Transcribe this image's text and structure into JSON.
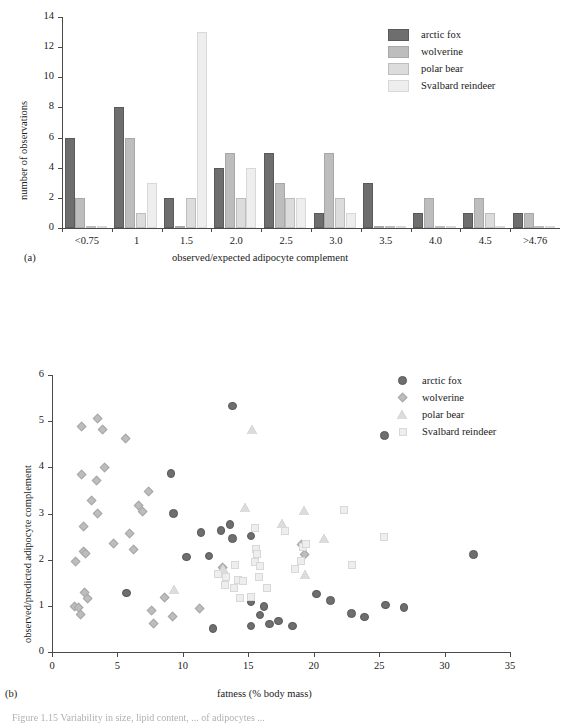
{
  "figure": {
    "caption_fragment": "Figure 1.15   Variability in size, lipid content, ... of adipocytes ..."
  },
  "colors": {
    "arctic_fox": "#6e6e6e",
    "wolverine": "#bdbdbd",
    "polar_bear": "#dcdcdc",
    "svalbard_reindeer": "#eeeeee",
    "axis": "#4a4a4a",
    "text": "#1a1a1a",
    "marker_edge": "#9a9a9a"
  },
  "panel_a": {
    "letter": "(a)",
    "chart_data": {
      "type": "bar",
      "title": "",
      "xlabel": "observed/expected adipocyte complement",
      "ylabel": "number of observations",
      "ylim": [
        0,
        14
      ],
      "ytickvals": [
        0,
        2,
        4,
        6,
        8,
        10,
        12,
        14
      ],
      "yticklabels": [
        "0",
        "2",
        "4",
        "6",
        "8",
        "10",
        "12",
        "14"
      ],
      "categories": [
        "<0.75",
        "1",
        "1.5",
        "2.0",
        "2.5",
        "3.0",
        "3.5",
        "4.0",
        "4.5",
        ">4.76"
      ],
      "grid": false,
      "legend_position": "top-right",
      "series": [
        {
          "name": "arctic fox",
          "values": [
            6,
            8,
            2,
            4,
            5,
            1,
            3,
            1,
            1,
            1
          ]
        },
        {
          "name": "wolverine",
          "values": [
            2,
            6,
            0,
            5,
            3,
            5,
            0,
            2,
            2,
            1
          ]
        },
        {
          "name": "polar bear",
          "values": [
            0,
            1,
            2,
            2,
            2,
            2,
            0,
            0,
            1,
            0
          ]
        },
        {
          "name": "Svalbard reindeer",
          "values": [
            0,
            3,
            13,
            4,
            2,
            1,
            0,
            0,
            0,
            0
          ]
        }
      ]
    },
    "legend": [
      {
        "label": "arctic fox",
        "swatch": "arctic_fox"
      },
      {
        "label": "wolverine",
        "swatch": "wolverine"
      },
      {
        "label": "polar bear",
        "swatch": "polar_bear"
      },
      {
        "label": "Svalbard reindeer",
        "swatch": "svalbard_reindeer"
      }
    ]
  },
  "panel_b": {
    "letter": "(b)",
    "chart_data": {
      "type": "scatter",
      "title": "",
      "xlabel": "fatness (% body mass)",
      "ylabel": "observed/predicted adipocyte complement",
      "xlim": [
        0,
        35
      ],
      "ylim": [
        0,
        6
      ],
      "xtickvals": [
        0,
        5,
        10,
        15,
        20,
        25,
        30,
        35
      ],
      "xticklabels": [
        "0",
        "5",
        "10",
        "15",
        "20",
        "25",
        "30",
        "35"
      ],
      "ytickvals": [
        0,
        1,
        2,
        3,
        4,
        5,
        6
      ],
      "yticklabels": [
        "0",
        "1",
        "2",
        "3",
        "4",
        "5",
        "6"
      ],
      "grid": false,
      "legend_position": "top-right",
      "series": [
        {
          "name": "arctic fox",
          "marker": "circle",
          "points": [
            [
              9.1,
              3.87
            ],
            [
              9.3,
              3.0
            ],
            [
              10.3,
              2.06
            ],
            [
              11.4,
              2.59
            ],
            [
              12.0,
              2.08
            ],
            [
              12.3,
              0.51
            ],
            [
              12.9,
              2.63
            ],
            [
              13.1,
              1.69
            ],
            [
              13.6,
              2.76
            ],
            [
              13.8,
              2.46
            ],
            [
              13.8,
              5.33
            ],
            [
              15.2,
              2.51
            ],
            [
              15.2,
              1.08
            ],
            [
              15.2,
              0.56
            ],
            [
              15.9,
              0.8
            ],
            [
              16.2,
              0.98
            ],
            [
              16.6,
              0.61
            ],
            [
              17.3,
              0.67
            ],
            [
              18.4,
              0.56
            ],
            [
              5.7,
              1.28
            ],
            [
              20.2,
              1.26
            ],
            [
              21.3,
              1.12
            ],
            [
              22.9,
              0.83
            ],
            [
              23.9,
              0.76
            ],
            [
              25.4,
              4.69
            ],
            [
              25.5,
              1.02
            ],
            [
              26.9,
              0.96
            ],
            [
              32.2,
              2.11
            ]
          ]
        },
        {
          "name": "wolverine",
          "marker": "diamond",
          "points": [
            [
              1.8,
              1.95
            ],
            [
              1.7,
              0.98
            ],
            [
              2.0,
              0.97
            ],
            [
              2.2,
              0.81
            ],
            [
              2.3,
              4.89
            ],
            [
              2.3,
              3.85
            ],
            [
              2.4,
              2.72
            ],
            [
              2.4,
              2.17
            ],
            [
              2.5,
              1.28
            ],
            [
              2.6,
              2.14
            ],
            [
              3.0,
              3.28
            ],
            [
              3.5,
              5.06
            ],
            [
              3.4,
              3.72
            ],
            [
              3.5,
              2.99
            ],
            [
              3.9,
              4.81
            ],
            [
              4.0,
              4.0
            ],
            [
              4.7,
              2.35
            ],
            [
              5.6,
              4.63
            ],
            [
              5.9,
              2.57
            ],
            [
              6.2,
              2.22
            ],
            [
              6.6,
              3.17
            ],
            [
              6.9,
              3.05
            ],
            [
              7.4,
              3.48
            ],
            [
              7.6,
              0.89
            ],
            [
              7.8,
              0.61
            ],
            [
              8.6,
              1.18
            ],
            [
              9.2,
              0.76
            ],
            [
              11.3,
              0.93
            ],
            [
              13.0,
              1.82
            ],
            [
              19.3,
              2.12
            ],
            [
              19.1,
              2.33
            ],
            [
              2.7,
              1.16
            ]
          ]
        },
        {
          "name": "polar bear",
          "marker": "triangle",
          "points": [
            [
              9.4,
              1.34
            ],
            [
              13.1,
              1.8
            ],
            [
              14.8,
              3.12
            ],
            [
              15.3,
              4.81
            ],
            [
              17.6,
              2.78
            ],
            [
              19.3,
              3.07
            ],
            [
              20.8,
              2.46
            ],
            [
              19.4,
              1.67
            ]
          ]
        },
        {
          "name": "Svalbard reindeer",
          "marker": "square",
          "points": [
            [
              12.7,
              1.7
            ],
            [
              13.3,
              1.62
            ],
            [
              13.2,
              1.45
            ],
            [
              14.0,
              1.88
            ],
            [
              14.2,
              1.56
            ],
            [
              14.4,
              1.18
            ],
            [
              14.6,
              1.53
            ],
            [
              15.2,
              1.2
            ],
            [
              15.5,
              2.68
            ],
            [
              15.5,
              1.96
            ],
            [
              15.6,
              2.23
            ],
            [
              15.7,
              2.12
            ],
            [
              15.8,
              1.62
            ],
            [
              15.9,
              1.86
            ],
            [
              16.4,
              1.38
            ],
            [
              17.8,
              2.63
            ],
            [
              18.6,
              1.79
            ],
            [
              19.0,
              1.97
            ],
            [
              19.2,
              2.28
            ],
            [
              19.4,
              2.33
            ],
            [
              22.3,
              3.08
            ],
            [
              22.9,
              1.88
            ],
            [
              25.4,
              2.49
            ],
            [
              13.9,
              1.38
            ]
          ]
        }
      ]
    },
    "legend": [
      {
        "label": "arctic fox",
        "marker": "circle",
        "swatch": "arctic_fox"
      },
      {
        "label": "wolverine",
        "marker": "diamond",
        "swatch": "wolverine"
      },
      {
        "label": "polar bear",
        "marker": "triangle",
        "swatch": "polar_bear"
      },
      {
        "label": "Svalbard reindeer",
        "marker": "square",
        "swatch": "svalbard_reindeer"
      }
    ]
  }
}
